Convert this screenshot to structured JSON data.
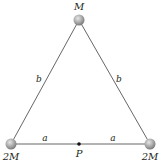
{
  "diagram": {
    "type": "physics-triangle-masses",
    "masses": [
      {
        "id": "top",
        "label": "M",
        "x": 79,
        "y": 20
      },
      {
        "id": "bottom-left",
        "label": "2M",
        "x": 11,
        "y": 144
      },
      {
        "id": "bottom-right",
        "label": "2M",
        "x": 150,
        "y": 144
      }
    ],
    "point": {
      "label": "P",
      "x": 79,
      "y": 144
    },
    "side_labels": {
      "left": "b",
      "right": "b",
      "bottom_left": "a",
      "bottom_right": "a"
    },
    "colors": {
      "line": "#555555",
      "sphere_light": "#e0e0e0",
      "sphere_dark": "#8a8a8a",
      "text": "#231f20"
    }
  }
}
